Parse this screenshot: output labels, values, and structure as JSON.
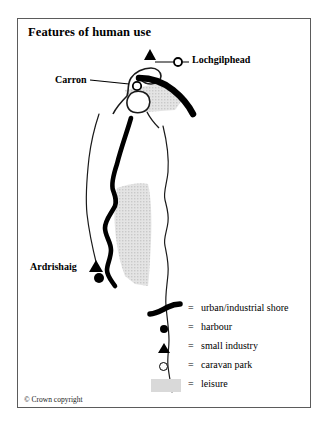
{
  "figure": {
    "title": "Features of human use",
    "copyright": "© Crown copyright",
    "frame_color": "#5b5b5b",
    "background": "#ffffff"
  },
  "map": {
    "labels": [
      {
        "id": "lochgilphead",
        "text": "Lochgilphead"
      },
      {
        "id": "carron",
        "text": "Carron"
      },
      {
        "id": "ardrishaig",
        "text": "Ardrishaig"
      }
    ],
    "markers": [
      {
        "type": "small-industry",
        "place": "Lochgilphead",
        "symbol": "triangle",
        "x": 150,
        "y": 56
      },
      {
        "type": "caravan-park",
        "place": "Lochgilphead",
        "symbol": "open-circle",
        "x": 178,
        "y": 62
      },
      {
        "type": "caravan-park",
        "place": "Carron",
        "symbol": "open-circle",
        "x": 124,
        "y": 86
      },
      {
        "type": "small-industry",
        "place": "Ardrishaig",
        "symbol": "triangle",
        "x": 96,
        "y": 266
      },
      {
        "type": "harbour",
        "place": "Ardrishaig",
        "symbol": "filled-circle",
        "x": 99,
        "y": 278
      }
    ],
    "features": {
      "urban_industrial_shore_color": "#000000",
      "leisure_fill_color": "#d9d9d9",
      "coastline_color": "#1a1a1a"
    }
  },
  "legend": {
    "equals": "=",
    "items": [
      {
        "symbol": "urban-industrial-shore",
        "label": "urban/industrial shore"
      },
      {
        "symbol": "harbour",
        "label": "harbour"
      },
      {
        "symbol": "small-industry",
        "label": "small industry"
      },
      {
        "symbol": "caravan-park",
        "label": "caravan park"
      },
      {
        "symbol": "leisure",
        "label": "leisure"
      }
    ]
  }
}
